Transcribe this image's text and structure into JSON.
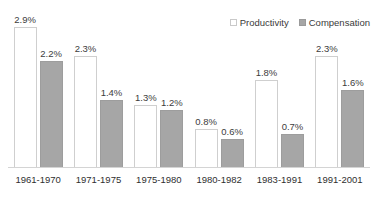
{
  "chart_data": {
    "type": "bar",
    "title": "",
    "subtitle": "",
    "xlabel": "",
    "ylabel": "",
    "ylim": [
      0,
      3.2
    ],
    "grid": false,
    "legend_position": "top-right",
    "value_format": "percent",
    "categories": [
      "1961-1970",
      "1971-1975",
      "1975-1980",
      "1980-1982",
      "1983-1991",
      "1991-2001"
    ],
    "series": [
      {
        "name": "Productivity",
        "color": "#ffffff",
        "border_color": "#cfcfcf",
        "values": [
          2.9,
          2.3,
          1.3,
          0.8,
          1.8,
          2.3
        ],
        "labels": [
          "2.9%",
          "2.3%",
          "1.3%",
          "0.8%",
          "1.8%",
          "2.3%"
        ]
      },
      {
        "name": "Compensation",
        "color": "#a6a6a6",
        "border_color": "#9d9d9d",
        "values": [
          2.2,
          1.4,
          1.2,
          0.6,
          0.7,
          1.6
        ],
        "labels": [
          "2.2%",
          "1.4%",
          "1.2%",
          "0.6%",
          "0.7%",
          "1.6%"
        ]
      }
    ]
  },
  "legend": {
    "items": [
      {
        "label": "Productivity",
        "swatch": "productivity"
      },
      {
        "label": "Compensation",
        "swatch": "compensation"
      }
    ]
  },
  "colors": {
    "background": "#ffffff",
    "baseline": "#d4d4d4",
    "text": "#2f2f2f",
    "productivity_fill": "#ffffff",
    "productivity_stroke": "#cfcfcf",
    "compensation_fill": "#a6a6a6",
    "compensation_stroke": "#9d9d9d"
  }
}
